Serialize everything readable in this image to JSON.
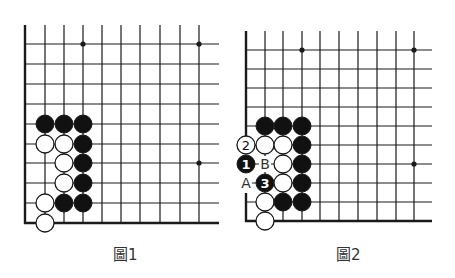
{
  "colors": {
    "line": "#1a1a1a",
    "black_stone": "#111111",
    "white_stone": "#ffffff",
    "background": "#ffffff",
    "caption": "#333333"
  },
  "diagrams": [
    {
      "caption": "圖1",
      "caption_pos": [
        113,
        258
      ],
      "grid": {
        "xs": [
          25,
          45,
          64,
          83,
          102,
          121,
          140,
          160,
          180,
          199
        ],
        "ys": [
          44,
          64,
          84,
          104,
          124,
          144,
          163,
          183,
          203,
          223
        ],
        "top": 25,
        "right": 219,
        "stone_r": 9
      },
      "left_border_gaps": [],
      "star_points": [
        [
          3,
          0
        ],
        [
          9,
          0
        ],
        [
          9,
          6
        ]
      ],
      "stones": [
        {
          "col": 1,
          "row": 4,
          "color": "black"
        },
        {
          "col": 2,
          "row": 4,
          "color": "black"
        },
        {
          "col": 3,
          "row": 4,
          "color": "black"
        },
        {
          "col": 1,
          "row": 5,
          "color": "white"
        },
        {
          "col": 2,
          "row": 5,
          "color": "white"
        },
        {
          "col": 3,
          "row": 5,
          "color": "black"
        },
        {
          "col": 2,
          "row": 6,
          "color": "white"
        },
        {
          "col": 3,
          "row": 6,
          "color": "black"
        },
        {
          "col": 2,
          "row": 7,
          "color": "white"
        },
        {
          "col": 3,
          "row": 7,
          "color": "black"
        },
        {
          "col": 1,
          "row": 8,
          "color": "white"
        },
        {
          "col": 2,
          "row": 8,
          "color": "black"
        },
        {
          "col": 3,
          "row": 8,
          "color": "black"
        },
        {
          "col": 1,
          "row": 9,
          "color": "white"
        }
      ],
      "labels": []
    },
    {
      "caption": "圖2",
      "caption_pos": [
        336,
        258
      ],
      "grid": {
        "xs": [
          246,
          265,
          283,
          302,
          320,
          339,
          358,
          377,
          396,
          414
        ],
        "ys": [
          50,
          69,
          88,
          107,
          126,
          145,
          164,
          183,
          202,
          221
        ],
        "top": 31,
        "right": 432,
        "stone_r": 9
      },
      "left_border_gaps": [
        [
          150,
          193
        ]
      ],
      "star_points": [
        [
          3,
          0
        ],
        [
          9,
          0
        ],
        [
          9,
          6
        ]
      ],
      "stones": [
        {
          "col": 1,
          "row": 4,
          "color": "black"
        },
        {
          "col": 2,
          "row": 4,
          "color": "black"
        },
        {
          "col": 3,
          "row": 4,
          "color": "black"
        },
        {
          "col": 0,
          "row": 5,
          "color": "white",
          "number": "2"
        },
        {
          "col": 1,
          "row": 5,
          "color": "white"
        },
        {
          "col": 2,
          "row": 5,
          "color": "white"
        },
        {
          "col": 3,
          "row": 5,
          "color": "black"
        },
        {
          "col": 0,
          "row": 6,
          "color": "black",
          "number": "1"
        },
        {
          "col": 2,
          "row": 6,
          "color": "white"
        },
        {
          "col": 3,
          "row": 6,
          "color": "black"
        },
        {
          "col": 1,
          "row": 7,
          "color": "black",
          "number": "3"
        },
        {
          "col": 2,
          "row": 7,
          "color": "white"
        },
        {
          "col": 3,
          "row": 7,
          "color": "black"
        },
        {
          "col": 1,
          "row": 8,
          "color": "white"
        },
        {
          "col": 2,
          "row": 8,
          "color": "black"
        },
        {
          "col": 3,
          "row": 8,
          "color": "black"
        },
        {
          "col": 1,
          "row": 9,
          "color": "white"
        }
      ],
      "labels": [
        {
          "col": 1,
          "row": 6,
          "text": "B"
        },
        {
          "col": 0,
          "row": 7,
          "text": "A"
        }
      ]
    }
  ]
}
